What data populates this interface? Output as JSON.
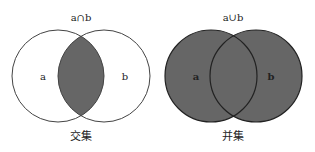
{
  "intersection": {
    "title": "a∩b",
    "set_a_label": "a",
    "set_b_label": "b",
    "caption": "交集",
    "circle_a": {
      "cx": 58,
      "cy": 76,
      "r": 46
    },
    "circle_b": {
      "cx": 104,
      "cy": 76,
      "r": 46
    }
  },
  "union": {
    "title": "a∪b",
    "set_a_label": "a",
    "set_b_label": "b",
    "caption": "并集",
    "circle_a": {
      "cx": 211,
      "cy": 76,
      "r": 46
    },
    "circle_b": {
      "cx": 256,
      "cy": 76,
      "r": 46
    }
  },
  "colors": {
    "fill": "#666666",
    "stroke": "#333333",
    "background": "#ffffff"
  }
}
